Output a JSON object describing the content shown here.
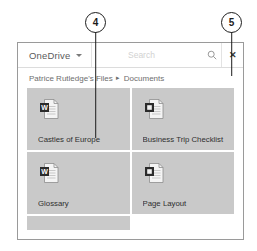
{
  "callouts": [
    {
      "number": "4",
      "points_to": "file-tile-castles-of-europe"
    },
    {
      "number": "5",
      "points_to": "close-button"
    }
  ],
  "dialog": {
    "header": {
      "brand_label": "OneDrive",
      "brand_caret_icon": "chevron-down-icon",
      "search": {
        "placeholder": "Search",
        "value": "",
        "icon": "search-icon"
      },
      "close_label": "✕",
      "close_icon": "close-icon"
    },
    "breadcrumb": {
      "separator": "▸",
      "items": [
        "Patrice Rutledge's Files",
        "Documents"
      ]
    },
    "files": [
      {
        "name": "Castles of Europe",
        "icon": "word-document-icon",
        "badge": "W"
      },
      {
        "name": "Business Trip Checklist",
        "icon": "document-icon",
        "badge": ""
      },
      {
        "name": "Glossary",
        "icon": "word-document-icon",
        "badge": "W"
      },
      {
        "name": "Page Layout",
        "icon": "document-icon",
        "badge": ""
      }
    ]
  },
  "colors": {
    "tile_background": "#c9c9c9",
    "window_border": "#9a9a9a",
    "text_primary": "#2f2f2f",
    "text_muted": "#6e6e6e",
    "callout_stroke": "#1c1c1c"
  }
}
